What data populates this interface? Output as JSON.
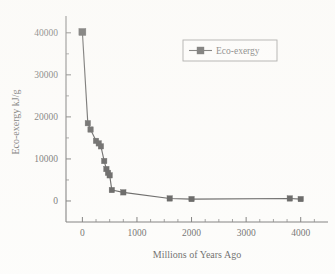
{
  "chart_data": {
    "type": "line",
    "title": "",
    "xlabel": "Millions of Years Ago",
    "ylabel": "Eco-exergy kJ/g",
    "xlim": [
      -300,
      4500
    ],
    "ylim": [
      -5000,
      44000
    ],
    "grid": false,
    "legend_position": "top-right",
    "xticks": [
      0,
      1000,
      2000,
      3000,
      4000
    ],
    "xtick_labels": [
      "0",
      "1000",
      "2000",
      "3000",
      "4000"
    ],
    "yticks": [
      0,
      10000,
      20000,
      30000,
      40000
    ],
    "ytick_labels": [
      "0",
      "10000",
      "20000",
      "30000",
      "40000"
    ],
    "x_minor_tick_step": 250,
    "y_minor_tick_step": 5000,
    "series": [
      {
        "name": "Eco-exergy",
        "marker": "filled-square",
        "color": "#0d0d0d",
        "x": [
          0,
          100,
          150,
          250,
          300,
          340,
          400,
          440,
          470,
          500,
          540,
          750,
          1600,
          2000,
          3800,
          4000
        ],
        "y": [
          40200,
          18500,
          17000,
          14300,
          13700,
          13000,
          9500,
          7600,
          6700,
          6100,
          2600,
          2050,
          600,
          450,
          600,
          450
        ]
      }
    ],
    "legend_entries": [
      "Eco-exergy"
    ]
  },
  "figure": {
    "legend_label": "Eco-exergy"
  }
}
